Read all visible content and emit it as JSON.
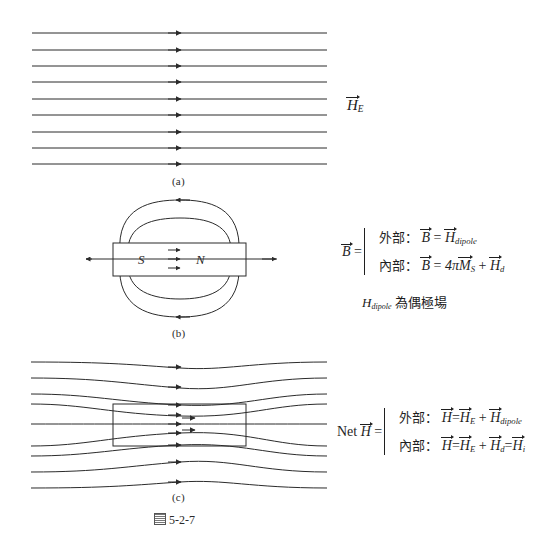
{
  "figure": {
    "caption": "5-2-7",
    "caption_prefix_icon": "book-figure-icon",
    "panels": [
      {
        "id": "a",
        "label": "(a)",
        "description": "uniform external field lines"
      },
      {
        "id": "b",
        "label": "(b)",
        "description": "bar magnet dipole field"
      },
      {
        "id": "c",
        "label": "(c)",
        "description": "net field lines around magnetized body"
      }
    ]
  },
  "panel_a": {
    "field_label_symbol": "H",
    "field_label_subscript": "E",
    "line_count": 9
  },
  "panel_b": {
    "pole_left": "S",
    "pole_right": "N",
    "equation": {
      "lhs_symbol": "B",
      "rows": [
        {
          "region": "外部",
          "colon": "：",
          "lhs": "B",
          "eq": "=",
          "rhs_symbol": "H",
          "rhs_sub": "dipole"
        },
        {
          "region": "內部",
          "colon": "：",
          "lhs": "B",
          "eq": "=",
          "coefficient": "4π",
          "term1_symbol": "M",
          "term1_sub": "S",
          "plus": "+",
          "term2_symbol": "H",
          "term2_sub": "d"
        }
      ],
      "note": {
        "symbol": "H",
        "subscript": "dipole",
        "text": "為偶極場"
      }
    }
  },
  "panel_c": {
    "equation": {
      "lead": "Net",
      "lhs_symbol": "H",
      "rows": [
        {
          "region": "外部",
          "colon": "：",
          "lhs": "H",
          "eq": "=",
          "term1_symbol": "H",
          "term1_sub": "E",
          "plus": "+",
          "term2_symbol": "H",
          "term2_sub": "dipole"
        },
        {
          "region": "內部",
          "colon": "：",
          "lhs": "H",
          "eq": "=",
          "term1_symbol": "H",
          "term1_sub": "E",
          "plus": "+",
          "term2_symbol": "H",
          "term2_sub": "d",
          "eq2": "=",
          "term3_symbol": "H",
          "term3_sub": "i"
        }
      ]
    }
  },
  "colors": {
    "ink": "#1a1a1a",
    "line": "#2b2b2b",
    "background": "#ffffff"
  }
}
